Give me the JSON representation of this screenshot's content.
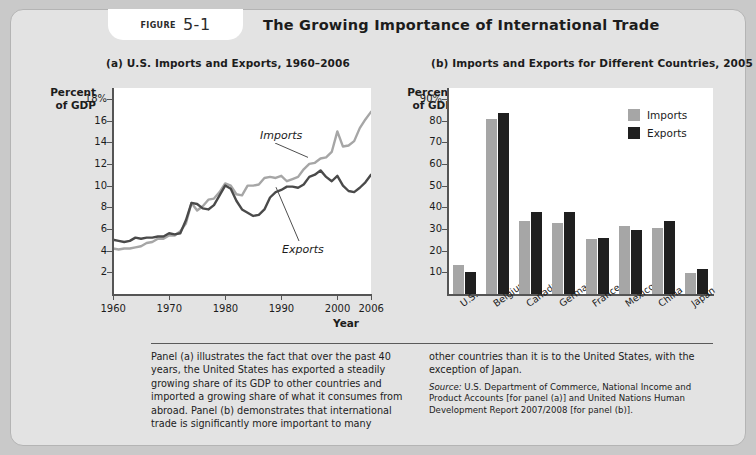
{
  "figure": {
    "badge_label": "Figure",
    "badge_number": "5-1",
    "title": "The Growing Importance of International Trade"
  },
  "panel_a": {
    "title": "(a) U.S. Imports and Exports, 1960–2006",
    "ylabel": "Percent\nof GDP",
    "xlabel": "Year",
    "series_labels": {
      "imports": "Imports",
      "exports": "Exports"
    }
  },
  "panel_b": {
    "title": "(b) Imports and Exports for Different Countries, 2005",
    "ylabel": "Percent\nof GDP",
    "legend": [
      {
        "label": "Imports",
        "color": "#a6a6a6"
      },
      {
        "label": "Exports",
        "color": "#1f1f1f"
      }
    ]
  },
  "caption": {
    "left": "Panel (a) illustrates the fact that over the past 40 years, the United States has exported a steadily growing share of its GDP to other countries and imported a growing share of what it consumes from abroad. Panel (b) demonstrates that international trade is significantly more important to many",
    "right": "other countries than it is to the United States, with the exception of Japan.",
    "source_word": "Source:",
    "source_text": " U.S. Department of Commerce, National Income and Product Accounts [for panel (a)] and United Nations Human Development Report 2007/2008 [for panel (b)]."
  },
  "colors": {
    "imports": "#a6a6a6",
    "exports": "#4a4a4a",
    "exports_bar": "#1f1f1f",
    "card_bg": "#e3e3e3",
    "plot_bg": "#ffffff",
    "axis": "#555555"
  },
  "chart_data": [
    {
      "type": "line",
      "title": "(a) U.S. Imports and Exports, 1960–2006",
      "xlabel": "Year",
      "ylabel": "Percent of GDP",
      "xlim": [
        1960,
        2006
      ],
      "ylim": [
        0,
        19
      ],
      "xticks": [
        1960,
        1970,
        1980,
        1990,
        2000,
        2006
      ],
      "xtick_labels": [
        "1960",
        "1970",
        "1980",
        "1990",
        "2000",
        "2006"
      ],
      "yticks": [
        2,
        4,
        6,
        8,
        10,
        12,
        14,
        16,
        18
      ],
      "ytick_labels": [
        "2",
        "4",
        "6",
        "8",
        "10",
        "12",
        "14",
        "16",
        "18%"
      ],
      "grid": false,
      "legend": "inline-annotations",
      "x": [
        1960,
        1961,
        1962,
        1963,
        1964,
        1965,
        1966,
        1967,
        1968,
        1969,
        1970,
        1971,
        1972,
        1973,
        1974,
        1975,
        1976,
        1977,
        1978,
        1979,
        1980,
        1981,
        1982,
        1983,
        1984,
        1985,
        1986,
        1987,
        1988,
        1989,
        1990,
        1991,
        1992,
        1993,
        1994,
        1995,
        1996,
        1997,
        1998,
        1999,
        2000,
        2001,
        2002,
        2003,
        2004,
        2005,
        2006
      ],
      "series": [
        {
          "name": "Imports",
          "color": "#a6a6a6",
          "values": [
            4.2,
            4.1,
            4.2,
            4.2,
            4.3,
            4.4,
            4.7,
            4.8,
            5.1,
            5.1,
            5.4,
            5.4,
            5.8,
            6.5,
            8.4,
            7.7,
            8.1,
            8.7,
            8.8,
            9.4,
            10.2,
            10.0,
            9.2,
            9.1,
            10.0,
            10.0,
            10.1,
            10.7,
            10.8,
            10.7,
            10.9,
            10.4,
            10.6,
            10.8,
            11.5,
            12.0,
            12.1,
            12.5,
            12.6,
            13.1,
            15.0,
            13.6,
            13.7,
            14.1,
            15.3,
            16.1,
            16.8
          ]
        },
        {
          "name": "Exports",
          "color": "#4a4a4a",
          "values": [
            5.0,
            4.9,
            4.8,
            4.9,
            5.2,
            5.1,
            5.2,
            5.2,
            5.3,
            5.3,
            5.6,
            5.5,
            5.6,
            6.8,
            8.4,
            8.3,
            7.9,
            7.8,
            8.2,
            9.1,
            10.0,
            9.7,
            8.6,
            7.8,
            7.5,
            7.2,
            7.3,
            7.8,
            8.9,
            9.4,
            9.6,
            9.9,
            9.9,
            9.8,
            10.1,
            10.8,
            11.0,
            11.4,
            10.8,
            10.4,
            10.9,
            10.0,
            9.5,
            9.4,
            9.8,
            10.3,
            11.0
          ]
        }
      ]
    },
    {
      "type": "bar",
      "title": "(b) Imports and Exports for Different Countries, 2005",
      "xlabel": "",
      "ylabel": "Percent of GDP",
      "ylim": [
        0,
        95
      ],
      "yticks": [
        10,
        20,
        30,
        40,
        50,
        60,
        70,
        80,
        90
      ],
      "ytick_labels": [
        "10",
        "20",
        "30",
        "40",
        "50",
        "60",
        "70",
        "80",
        "90%"
      ],
      "grid": false,
      "legend": "top-right",
      "categories": [
        "U.S.",
        "Belgium",
        "Canada",
        "Germany",
        "France",
        "Mexico",
        "China",
        "Japan"
      ],
      "series": [
        {
          "name": "Imports",
          "color": "#a6a6a6",
          "values": [
            13.5,
            80.5,
            33.8,
            32.8,
            25.5,
            31.5,
            30.5,
            9.6
          ]
        },
        {
          "name": "Exports",
          "color": "#1f1f1f",
          "values": [
            10.0,
            83.5,
            37.7,
            37.7,
            25.7,
            29.4,
            33.5,
            11.4
          ]
        }
      ]
    }
  ]
}
